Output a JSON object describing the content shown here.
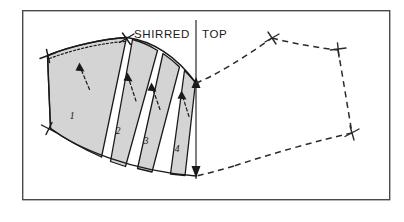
{
  "figure": {
    "title": "SHIRRED TOP",
    "title_words": [
      "SHIRRED",
      "TOP"
    ],
    "type": "sewing-pattern-slash-and-spread-diagram",
    "background_color": "#ffffff",
    "frame": {
      "x": 22,
      "y": 10,
      "width": 368,
      "height": 190,
      "stroke_color": "#4a4a4a"
    },
    "colors": {
      "piece_fill": "#d4d4d4",
      "outline": "#1a1a1a",
      "dashed_outline": "#2b2b2b",
      "frame": "#4a4a4a"
    }
  },
  "labels": {
    "heading": "SHIRRED TOP",
    "heading_left": "SHIRRED",
    "heading_right": "TOP"
  },
  "pattern_pieces": {
    "count": 4,
    "shading": "gray",
    "segments": [
      {
        "id": 1,
        "label": "1",
        "label_x": 72,
        "label_y": 119,
        "kind": "main-panel"
      },
      {
        "id": 2,
        "label": "2",
        "label_x": 118,
        "label_y": 134,
        "kind": "spread-strip"
      },
      {
        "id": 3,
        "label": "3",
        "label_x": 146,
        "label_y": 144,
        "kind": "spread-strip"
      },
      {
        "id": 4,
        "label": "4",
        "label_x": 177,
        "label_y": 152,
        "kind": "spread-strip"
      }
    ]
  },
  "markings": {
    "notches": [
      {
        "name": "upper-left-notch",
        "x": 47,
        "y": 55
      },
      {
        "name": "apex-notch",
        "x": 127,
        "y": 38
      },
      {
        "name": "lower-left-notch",
        "x": 48,
        "y": 128
      },
      {
        "name": "mirror-apex-notch",
        "x": 272,
        "y": 37
      },
      {
        "name": "mirror-top-right-notch",
        "x": 338,
        "y": 50
      },
      {
        "name": "mirror-bottom-right-notch",
        "x": 352,
        "y": 133
      }
    ],
    "spread_arrows": [
      {
        "name": "spread-arrow-1",
        "tail_x": 88,
        "tail_y": 88,
        "head_x": 79,
        "head_y": 64
      },
      {
        "name": "spread-arrow-2",
        "tail_x": 135,
        "tail_y": 100,
        "head_x": 128,
        "head_y": 74
      },
      {
        "name": "spread-arrow-3",
        "tail_x": 159,
        "tail_y": 108,
        "head_x": 152,
        "head_y": 84
      },
      {
        "name": "spread-arrow-4",
        "tail_x": 188,
        "tail_y": 115,
        "head_x": 182,
        "head_y": 92
      }
    ],
    "center_axis": {
      "name": "center-front-axis",
      "x": 196,
      "y_top": 20,
      "y_bottom": 180,
      "arrow_up_y": 80,
      "arrow_down_y": 176
    },
    "stitch_line": "dotted seam line along curved upper edge of panel 1",
    "mirror_outline": "dashed mirrored pattern half on the right side"
  }
}
